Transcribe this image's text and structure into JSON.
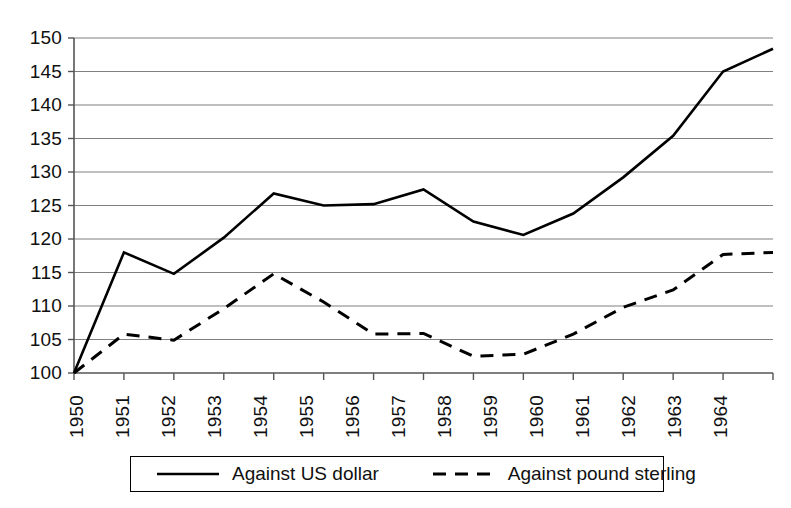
{
  "chart_data": {
    "type": "line",
    "title": "",
    "subtitle": "",
    "xlabel": "",
    "ylabel": "",
    "x": [
      1950,
      1951,
      1952,
      1953,
      1954,
      1955,
      1956,
      1957,
      1958,
      1959,
      1960,
      1961,
      1962,
      1963,
      1964
    ],
    "categories": [
      "1950",
      "1951",
      "1952",
      "1953",
      "1954",
      "1955",
      "1956",
      "1957",
      "1958",
      "1959",
      "1960",
      "1961",
      "1962",
      "1963",
      "1964"
    ],
    "series": [
      {
        "name": "Against US dollar",
        "style": "solid",
        "color": "#000000",
        "values": [
          100,
          118,
          114.8,
          120.2,
          126.8,
          125,
          125.2,
          127.4,
          122.6,
          120.6,
          123.8,
          129.2,
          135.4,
          145,
          148.4
        ]
      },
      {
        "name": "Against pound sterling",
        "style": "dashed",
        "color": "#000000",
        "values": [
          100,
          105.8,
          104.9,
          109.6,
          114.8,
          110.6,
          105.8,
          105.9,
          102.5,
          102.8,
          105.8,
          109.8,
          112.4,
          117.7,
          118
        ]
      }
    ],
    "ylim": [
      100,
      150
    ],
    "y_ticks": [
      100,
      105,
      110,
      115,
      120,
      125,
      130,
      135,
      140,
      145,
      150
    ],
    "y_tick_labels": [
      "100",
      "105",
      "110",
      "115",
      "120",
      "125",
      "130",
      "135",
      "140",
      "145",
      "150"
    ],
    "xlim": [
      1950,
      1964
    ],
    "grid": {
      "horizontal": true,
      "vertical": false,
      "color": "#808080"
    },
    "legend": {
      "position": "bottom",
      "entries": [
        {
          "label": "Against US dollar",
          "style": "solid"
        },
        {
          "label": "Against pound sterling",
          "style": "dashed"
        }
      ]
    },
    "axes": {
      "left_spine": true,
      "bottom_spine": true,
      "tick_marks": true,
      "x_tick_label_rotation": -90
    }
  }
}
